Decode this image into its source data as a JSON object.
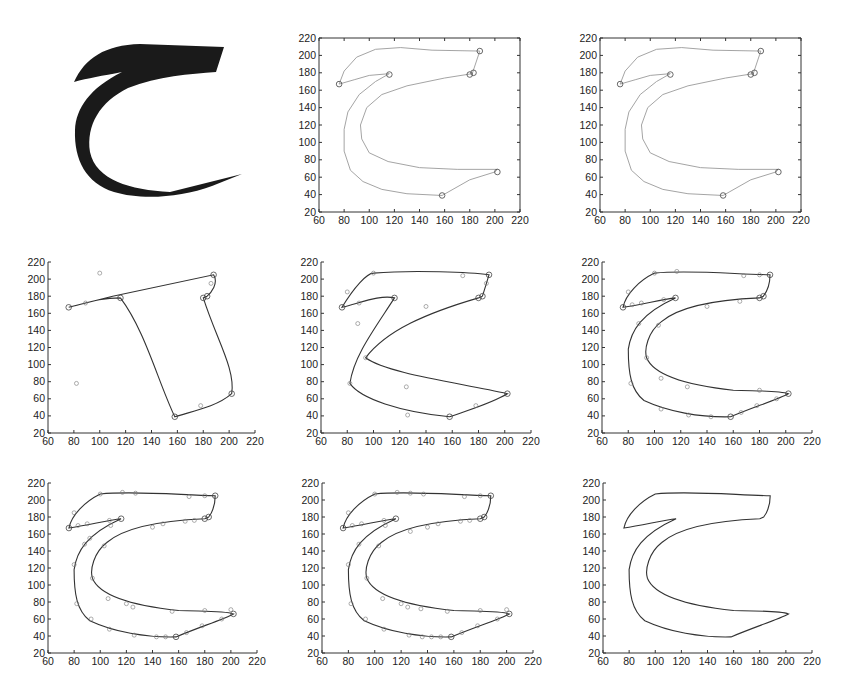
{
  "figure": {
    "glyph": {
      "character": "ح",
      "color": "#1a1a1a"
    },
    "axes": {
      "xlim": [
        60,
        220
      ],
      "ylim": [
        20,
        220
      ],
      "xticks": [
        "60",
        "80",
        "100",
        "120",
        "140",
        "160",
        "180",
        "200",
        "220"
      ],
      "yticks": [
        "20",
        "40",
        "60",
        "80",
        "100",
        "120",
        "140",
        "160",
        "180",
        "200",
        "220"
      ]
    },
    "colors": {
      "outline_light": "#9a9a9a",
      "curve_dark": "#333333",
      "axis": "#333333"
    },
    "panels": [
      {
        "id": "glyph-bitmap",
        "label": "Original bitmap glyph"
      },
      {
        "id": "extracted-outline",
        "label": "Extracted contour"
      },
      {
        "id": "contour-with-corners",
        "label": "Contour with detected corner points"
      },
      {
        "id": "initial-fit",
        "label": "Initial curve fit through corners"
      },
      {
        "id": "fit-iteration-2",
        "label": "Curve fit iteration"
      },
      {
        "id": "fit-iteration-3",
        "label": "Curve fit iteration"
      },
      {
        "id": "fit-iteration-4",
        "label": "Curve fit iteration"
      },
      {
        "id": "fit-iteration-5",
        "label": "Curve fit iteration"
      },
      {
        "id": "fit-final",
        "label": "Final curve fit"
      }
    ]
  },
  "chart_data": [
    {
      "type": "line",
      "title": "Extracted contour",
      "xlim": [
        60,
        220
      ],
      "ylim": [
        20,
        220
      ],
      "grid": false,
      "outer_contour": [
        [
          76,
          167
        ],
        [
          80,
          182
        ],
        [
          90,
          198
        ],
        [
          105,
          207
        ],
        [
          125,
          209
        ],
        [
          150,
          206
        ],
        [
          188,
          205
        ],
        [
          182,
          179
        ],
        [
          160,
          174
        ],
        [
          130,
          165
        ],
        [
          110,
          155
        ],
        [
          98,
          140
        ],
        [
          93,
          120
        ],
        [
          94,
          104
        ],
        [
          100,
          88
        ],
        [
          115,
          78
        ],
        [
          140,
          71
        ],
        [
          170,
          69
        ],
        [
          202,
          69
        ],
        [
          200,
          66
        ],
        [
          180,
          57
        ],
        [
          158,
          39
        ],
        [
          130,
          41
        ],
        [
          110,
          46
        ],
        [
          95,
          55
        ],
        [
          85,
          68
        ],
        [
          80,
          90
        ],
        [
          80,
          115
        ],
        [
          83,
          135
        ],
        [
          92,
          155
        ],
        [
          105,
          170
        ],
        [
          116,
          179
        ],
        [
          100,
          177
        ],
        [
          88,
          172
        ],
        [
          76,
          167
        ]
      ]
    },
    {
      "type": "scatter",
      "title": "Contour with corner points",
      "xlim": [
        60,
        220
      ],
      "ylim": [
        20,
        220
      ],
      "corner_points": [
        [
          76,
          167
        ],
        [
          116,
          178
        ],
        [
          188,
          205
        ],
        [
          183,
          180
        ],
        [
          180,
          178
        ],
        [
          202,
          66
        ],
        [
          158,
          39
        ]
      ]
    },
    {
      "type": "line",
      "title": "Initial fit",
      "xlim": [
        60,
        220
      ],
      "ylim": [
        20,
        220
      ],
      "corner_points": [
        [
          76,
          167
        ],
        [
          116,
          178
        ],
        [
          188,
          205
        ],
        [
          183,
          180
        ],
        [
          180,
          178
        ],
        [
          202,
          66
        ],
        [
          158,
          39
        ]
      ]
    }
  ]
}
